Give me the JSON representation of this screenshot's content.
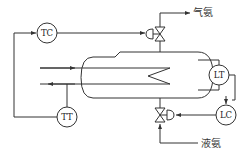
{
  "diagram": {
    "type": "process-control-schematic",
    "instruments": {
      "tc": {
        "label": "TC"
      },
      "tt": {
        "label": "TT"
      },
      "lt": {
        "label": "LT"
      },
      "lc": {
        "label": "LC"
      }
    },
    "streams": {
      "gas_out": {
        "label": "气氨"
      },
      "liquid_in": {
        "label": "液氨"
      }
    },
    "colors": {
      "line": "#333333",
      "background": "#ffffff"
    }
  }
}
